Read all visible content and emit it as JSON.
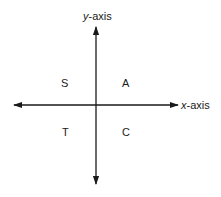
{
  "diagram": {
    "axes": {
      "y_axis": {
        "variable": "y",
        "suffix": "-axis"
      },
      "x_axis": {
        "variable": "x",
        "suffix": "-axis"
      }
    },
    "quadrants": {
      "top_left": "S",
      "top_right": "A",
      "bottom_left": "T",
      "bottom_right": "C"
    },
    "colors": {
      "line": "#1a1a1a",
      "background": "#ffffff"
    }
  }
}
